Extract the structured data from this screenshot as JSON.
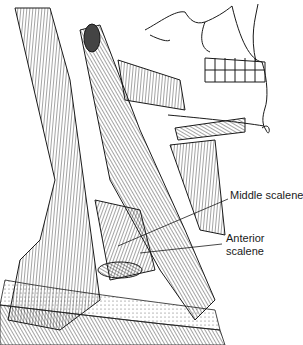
{
  "figure": {
    "labels": [
      {
        "id": "middle-scalene",
        "text": "Middle scalene"
      },
      {
        "id": "anterior-scalene",
        "line1": "Anterior",
        "line2": "scalene"
      }
    ],
    "colors": {
      "ink": "#1a1a1a",
      "background": "#ffffff",
      "shade": "#555555"
    }
  }
}
